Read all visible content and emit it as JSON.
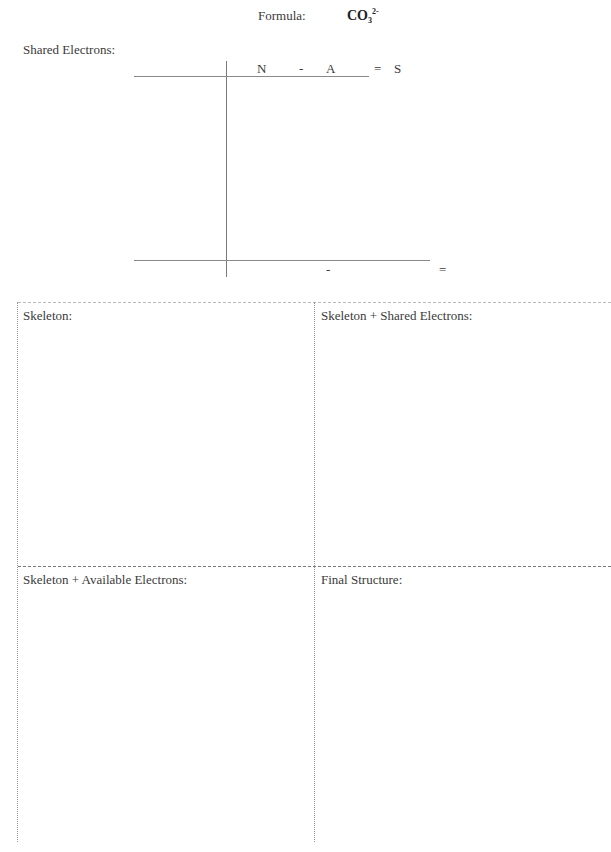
{
  "header": {
    "formula_label": "Formula:",
    "formula_value": {
      "base": "CO",
      "subscript": "3",
      "superscript": "2-"
    }
  },
  "shared_electrons": {
    "label": "Shared Electrons:",
    "columns": {
      "n": "N",
      "minus": "-",
      "a": "A",
      "equals": "=",
      "s": "S"
    },
    "totals_row": {
      "minus": "-",
      "equals": "="
    }
  },
  "boxes": [
    {
      "title": "Skeleton:"
    },
    {
      "title": "Skeleton + Shared Electrons:"
    },
    {
      "title": "Skeleton + Available Electrons:"
    },
    {
      "title": "Final Structure:"
    }
  ]
}
